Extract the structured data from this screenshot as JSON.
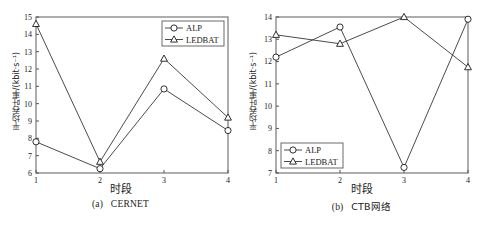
{
  "figure": {
    "panels": [
      {
        "id": "panel-a",
        "caption_prefix": "(a)",
        "caption_name": "CERNET",
        "xlabel": "时段",
        "ylabel": "平均吞吐率/(kbit·s⁻¹)"
      },
      {
        "id": "panel-b",
        "caption_prefix": "(b)",
        "caption_name": "CTB网络",
        "xlabel": "时段",
        "ylabel": "平均吞吐率/(kbit·s⁻¹)"
      }
    ],
    "legend": {
      "alp": "ALP",
      "ledbat": "LEDBAT"
    }
  },
  "chart_data": [
    {
      "type": "line",
      "title": "(a) CERNET",
      "xlabel": "时段",
      "ylabel": "平均吞吐率/(kbit·s⁻¹)",
      "categories": [
        "1",
        "2",
        "3",
        "4"
      ],
      "x": [
        1,
        2,
        3,
        4
      ],
      "xlim": [
        1,
        4
      ],
      "ylim": [
        6,
        15
      ],
      "yticks": [
        6,
        7,
        8,
        9,
        10,
        11,
        12,
        13,
        14,
        15
      ],
      "xticks": [
        1,
        2,
        3,
        4
      ],
      "grid": false,
      "legend_position": "top-right",
      "series": [
        {
          "name": "ALP",
          "marker": "circle",
          "values": [
            7.8,
            6.25,
            10.85,
            8.45
          ]
        },
        {
          "name": "LEDBAT",
          "marker": "triangle",
          "values": [
            14.6,
            6.65,
            12.6,
            9.2
          ]
        }
      ]
    },
    {
      "type": "line",
      "title": "(b) CTB网络",
      "xlabel": "时段",
      "ylabel": "平均吞吐率/(kbit·s⁻¹)",
      "categories": [
        "1",
        "2",
        "3",
        "4"
      ],
      "x": [
        1,
        2,
        3,
        4
      ],
      "xlim": [
        1,
        4
      ],
      "ylim": [
        7,
        14
      ],
      "yticks": [
        7,
        8,
        9,
        10,
        11,
        12,
        13,
        14
      ],
      "xticks": [
        1,
        2,
        3,
        4
      ],
      "grid": false,
      "legend_position": "bottom-left",
      "series": [
        {
          "name": "ALP",
          "marker": "circle",
          "values": [
            12.2,
            13.55,
            7.25,
            13.9
          ]
        },
        {
          "name": "LEDBAT",
          "marker": "triangle",
          "values": [
            13.2,
            12.8,
            14.0,
            11.75
          ]
        }
      ]
    }
  ]
}
